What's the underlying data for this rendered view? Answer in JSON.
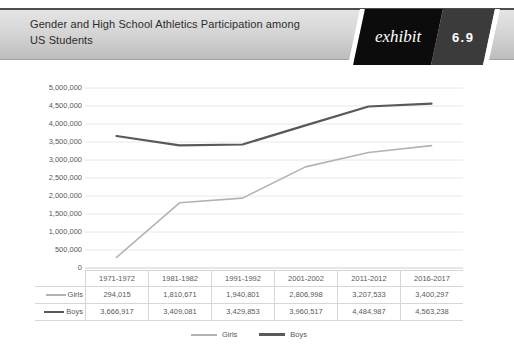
{
  "header": {
    "title_line1": "Gender and High School Athletics Participation among",
    "title_line2": "US Students",
    "exhibit_label": "exhibit",
    "exhibit_number": "6.9"
  },
  "colors": {
    "header_bar": "#d2d2d2",
    "exhibit_bg": "#0c0c0c",
    "exhibit_number_bg": "#3b3b3b",
    "axis_text": "#595959",
    "gridline": "#e8e8e8",
    "axis_line": "#cfcfcf",
    "table_border": "#d6d6d6"
  },
  "chart_data": {
    "type": "line",
    "title": "Gender and High School Athletics Participation among US Students",
    "categories": [
      "1971-1972",
      "1981-1982",
      "1991-1992",
      "2001-2002",
      "2011-2012",
      "2016-2017"
    ],
    "series": [
      {
        "name": "Girls",
        "values": [
          294015,
          1810671,
          1940801,
          2806998,
          3207533,
          3400297
        ],
        "color": "#b3b3b3",
        "stroke_width": 1.6
      },
      {
        "name": "Boys",
        "values": [
          3666917,
          3409081,
          3429853,
          3960517,
          4484987,
          4563238
        ],
        "color": "#595959",
        "stroke_width": 2.2
      }
    ],
    "y_axis": {
      "min": 0,
      "max": 5000000,
      "step": 500000
    },
    "grid": true,
    "legend_position": "bottom",
    "data_table_shown": true
  }
}
